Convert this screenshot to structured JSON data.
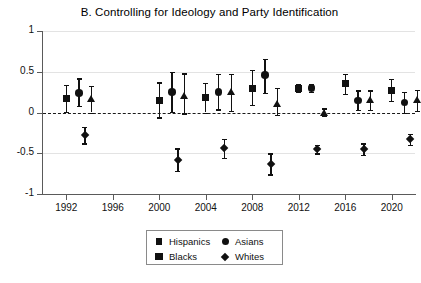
{
  "chart_data": {
    "type": "scatter",
    "title": "B. Controlling for Ideology and Party Identification",
    "xlabel": "",
    "ylabel": "",
    "xlim": [
      1990,
      2022
    ],
    "ylim": [
      -1,
      1
    ],
    "grid": true,
    "zero_reference_line": 0,
    "legend_position": "bottom-center",
    "x_ticks": [
      1992,
      1996,
      2000,
      2004,
      2008,
      2012,
      2016,
      2020
    ],
    "y_ticks": [
      -1,
      -0.5,
      0,
      0.5,
      1
    ],
    "y_tick_labels": [
      "-1",
      "-0.5",
      "0",
      "0.5",
      "1"
    ],
    "series": [
      {
        "name": "Hispanics",
        "marker": "square",
        "points": [
          {
            "x": 1992.0,
            "y": 0.17,
            "lo": 0.01,
            "hi": 0.34
          },
          {
            "x": 2000.0,
            "y": 0.15,
            "lo": -0.06,
            "hi": 0.37
          },
          {
            "x": 2004.0,
            "y": 0.18,
            "lo": 0.0,
            "hi": 0.36
          },
          {
            "x": 2008.0,
            "y": 0.3,
            "lo": 0.09,
            "hi": 0.52
          },
          {
            "x": 2012.0,
            "y": 0.3,
            "lo": 0.25,
            "hi": 0.35
          },
          {
            "x": 2016.0,
            "y": 0.35,
            "lo": 0.23,
            "hi": 0.47
          },
          {
            "x": 2020.0,
            "y": 0.27,
            "lo": 0.14,
            "hi": 0.41
          }
        ]
      },
      {
        "name": "Asians",
        "marker": "circle",
        "points": [
          {
            "x": 1993.1,
            "y": 0.24,
            "lo": 0.08,
            "hi": 0.42
          },
          {
            "x": 2001.1,
            "y": 0.25,
            "lo": 0.01,
            "hi": 0.5
          },
          {
            "x": 2005.1,
            "y": 0.25,
            "lo": 0.04,
            "hi": 0.47
          },
          {
            "x": 2009.1,
            "y": 0.46,
            "lo": 0.24,
            "hi": 0.66
          },
          {
            "x": 2013.1,
            "y": 0.3,
            "lo": 0.25,
            "hi": 0.35
          },
          {
            "x": 2017.1,
            "y": 0.15,
            "lo": 0.03,
            "hi": 0.27
          },
          {
            "x": 2021.1,
            "y": 0.12,
            "lo": 0.0,
            "hi": 0.25
          }
        ]
      },
      {
        "name": "Blacks",
        "marker": "triangle",
        "points": [
          {
            "x": 1994.2,
            "y": 0.17,
            "lo": 0.0,
            "hi": 0.33
          },
          {
            "x": 2002.2,
            "y": 0.2,
            "lo": -0.01,
            "hi": 0.48
          },
          {
            "x": 2006.2,
            "y": 0.25,
            "lo": 0.02,
            "hi": 0.47
          },
          {
            "x": 2010.2,
            "y": 0.1,
            "lo": -0.03,
            "hi": 0.3
          },
          {
            "x": 2014.2,
            "y": 0.0,
            "lo": -0.04,
            "hi": 0.05
          },
          {
            "x": 2018.2,
            "y": 0.15,
            "lo": 0.03,
            "hi": 0.27
          },
          {
            "x": 2022.2,
            "y": 0.15,
            "lo": 0.02,
            "hi": 0.28
          }
        ]
      },
      {
        "name": "Whites",
        "marker": "diamond",
        "points": [
          {
            "x": 1993.6,
            "y": -0.28,
            "lo": -0.38,
            "hi": -0.18
          },
          {
            "x": 2001.6,
            "y": -0.58,
            "lo": -0.72,
            "hi": -0.44
          },
          {
            "x": 2005.6,
            "y": -0.44,
            "lo": -0.56,
            "hi": -0.32
          },
          {
            "x": 2009.6,
            "y": -0.63,
            "lo": -0.76,
            "hi": -0.5
          },
          {
            "x": 2013.6,
            "y": -0.45,
            "lo": -0.5,
            "hi": -0.4
          },
          {
            "x": 2017.6,
            "y": -0.45,
            "lo": -0.52,
            "hi": -0.38
          },
          {
            "x": 2021.6,
            "y": -0.33,
            "lo": -0.4,
            "hi": -0.26
          }
        ]
      }
    ]
  },
  "legend": {
    "entries": [
      {
        "label": "Hispanics",
        "marker": "square"
      },
      {
        "label": "Asians",
        "marker": "circle"
      },
      {
        "label": "Blacks",
        "marker": "triangle"
      },
      {
        "label": "Whites",
        "marker": "diamond"
      }
    ]
  },
  "colors": {
    "marker": "#111111",
    "axis": "#5a5a5a",
    "grid": "#e3e3e3",
    "background": "#ffffff"
  }
}
